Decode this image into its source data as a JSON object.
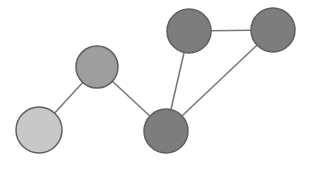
{
  "figure": {
    "background_color": "#ffffff",
    "width": 311,
    "height": 170
  },
  "style": {
    "edge_color": "#7a7a7a",
    "edge_width": 1.6,
    "node_stroke_color": "#5f5f5f",
    "node_stroke_width": 1.5,
    "fill_light": "#c8c8c8",
    "fill_medium": "#9e9e9e",
    "fill_dark": "#7d7d7d"
  },
  "chart_data": {
    "type": "scatter",
    "xlabel": "",
    "ylabel": "",
    "grid": false,
    "legend": "none",
    "xlim": [
      0,
      311
    ],
    "ylim": [
      0,
      170
    ],
    "nodes": [
      {
        "id": "A",
        "label": "",
        "x": 39,
        "y": 130,
        "r": 23,
        "color": "#c8c8c8",
        "shade": "light"
      },
      {
        "id": "B",
        "label": "",
        "x": 97,
        "y": 67,
        "r": 21,
        "color": "#9e9e9e",
        "shade": "medium"
      },
      {
        "id": "C",
        "label": "",
        "x": 166,
        "y": 131,
        "r": 22,
        "color": "#7d7d7d",
        "shade": "dark"
      },
      {
        "id": "D",
        "label": "",
        "x": 189,
        "y": 31,
        "r": 22,
        "color": "#7d7d7d",
        "shade": "dark"
      },
      {
        "id": "E",
        "label": "",
        "x": 273,
        "y": 30,
        "r": 22,
        "color": "#7d7d7d",
        "shade": "dark"
      }
    ],
    "edges": [
      {
        "source": "A",
        "target": "B"
      },
      {
        "source": "B",
        "target": "C"
      },
      {
        "source": "C",
        "target": "D"
      },
      {
        "source": "D",
        "target": "E"
      },
      {
        "source": "C",
        "target": "E"
      }
    ],
    "node_count": 5,
    "edge_count": 5
  }
}
